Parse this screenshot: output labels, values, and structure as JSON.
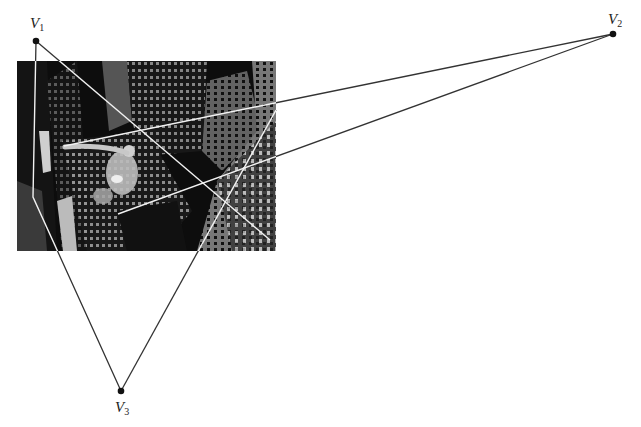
{
  "figure": {
    "vertices": [
      {
        "id": "V1",
        "letter": "V",
        "sub": "1",
        "x": 36,
        "y": 41,
        "label_x": 30,
        "label_y": 16
      },
      {
        "id": "V2",
        "letter": "V",
        "sub": "2",
        "x": 613,
        "y": 34,
        "label_x": 608,
        "label_y": 12
      },
      {
        "id": "V3",
        "letter": "V",
        "sub": "3",
        "x": 121,
        "y": 391,
        "label_x": 115,
        "label_y": 400
      }
    ],
    "photo": {
      "subject": "aerial night view of skyscrapers with a flying humanoid figure",
      "x": 17,
      "y": 61,
      "width": 259,
      "height": 190
    },
    "lines": [
      {
        "from": "V1",
        "points": [
          [
            36,
            41
          ],
          [
            33,
            197
          ],
          [
            121,
            391
          ]
        ]
      },
      {
        "from": "V1",
        "points": [
          [
            36,
            41
          ],
          [
            270,
            240
          ]
        ]
      },
      {
        "from": "V2",
        "points": [
          [
            613,
            34
          ],
          [
            64,
            146
          ]
        ]
      },
      {
        "from": "V2",
        "points": [
          [
            613,
            34
          ],
          [
            118,
            214
          ]
        ]
      },
      {
        "from": "V3",
        "points": [
          [
            121,
            391
          ],
          [
            276,
            110
          ]
        ]
      }
    ],
    "colors": {
      "line_outside": "#333333",
      "line_inside": "#f2f2f2",
      "vertex": "#111111"
    }
  }
}
